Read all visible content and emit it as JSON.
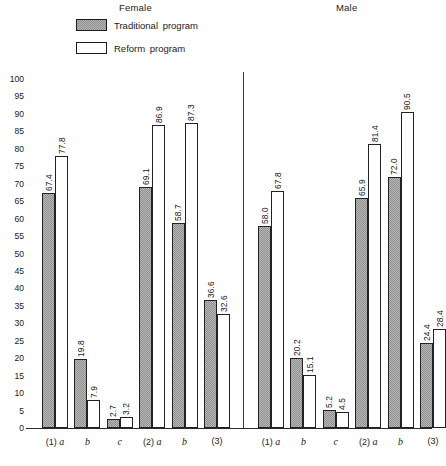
{
  "legend": {
    "items": [
      {
        "key": "traditional",
        "label": "Traditional  program",
        "swatch": "stippled-gray"
      },
      {
        "key": "reform",
        "label": "Reform  program",
        "swatch": "white"
      }
    ]
  },
  "groups": [
    {
      "key": "female",
      "caption": "Female"
    },
    {
      "key": "male",
      "caption": "Male"
    }
  ],
  "yaxis": {
    "ticks": [
      "100",
      "95",
      "90",
      "85",
      "80",
      "75",
      "70",
      "65",
      "60",
      "55",
      "50",
      "45",
      "40",
      "35",
      "30",
      "25",
      "20",
      "15",
      "10",
      "5",
      "0"
    ]
  },
  "xaxis": {
    "categories": [
      "(1) a",
      "b",
      "c",
      "(2) a",
      "b",
      "(3)"
    ]
  },
  "chart_data": {
    "type": "bar",
    "title": "",
    "xlabel": "",
    "ylabel": "",
    "ylim": [
      0,
      100
    ],
    "ytick_step": 5,
    "grid": false,
    "legend_position": "top-left",
    "panels": [
      {
        "name": "Female",
        "categories": [
          "(1) a",
          "b",
          "c",
          "(2) a",
          "b",
          "(3)"
        ],
        "series": [
          {
            "name": "Traditional program",
            "values": [
              67.4,
              19.8,
              2.7,
              69.1,
              58.7,
              36.6
            ]
          },
          {
            "name": "Reform program",
            "values": [
              77.8,
              7.9,
              3.2,
              86.9,
              87.3,
              32.6
            ]
          }
        ]
      },
      {
        "name": "Male",
        "categories": [
          "(1) a",
          "b",
          "c",
          "(2) a",
          "b",
          "(3)"
        ],
        "series": [
          {
            "name": "Traditional program",
            "values": [
              58.0,
              20.2,
              5.2,
              65.9,
              72.0,
              24.4
            ]
          },
          {
            "name": "Reform program",
            "values": [
              67.8,
              15.1,
              4.5,
              81.4,
              90.5,
              28.4
            ]
          }
        ]
      }
    ]
  },
  "bar_labels": {
    "female": {
      "traditional": [
        "67.4",
        "19.8",
        "2.7",
        "69.1",
        "58.7",
        "36.6"
      ],
      "reform": [
        "77.8",
        "7.9",
        "3.2",
        "86.9",
        "87.3",
        "32.6"
      ]
    },
    "male": {
      "traditional": [
        "58.0",
        "20.2",
        "5.2",
        "65.9",
        "72.0",
        "24.4"
      ],
      "reform": [
        "67.8",
        "15.1",
        "4.5",
        "81.4",
        "90.5",
        "28.4"
      ]
    }
  },
  "colors": {
    "traditional_fill": "#b7b7b7",
    "traditional_pattern": "#909090",
    "reform_fill": "#ffffff",
    "outline": "#222222",
    "axis": "#2a2a2a",
    "text": "#1a1a1a"
  }
}
